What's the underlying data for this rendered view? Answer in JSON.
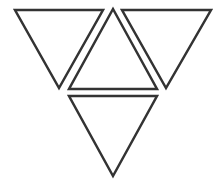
{
  "diagram": {
    "stroke_color": "#333333",
    "fill_color": "#ffffff",
    "background": "#ffffff",
    "stroke_width": 2.5,
    "triangles": [
      {
        "id": "top-left",
        "orientation": "down",
        "points": "15,10 103,10 59,88"
      },
      {
        "id": "center",
        "orientation": "up",
        "points": "113,9 157,89 69,89"
      },
      {
        "id": "top-right",
        "orientation": "down",
        "points": "122,10 211,10 166,88"
      },
      {
        "id": "bottom",
        "orientation": "down",
        "points": "69,96 157,96 113,176"
      }
    ]
  }
}
